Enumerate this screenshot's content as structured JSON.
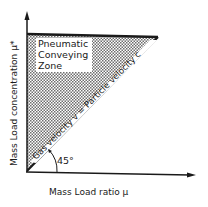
{
  "diagram": {
    "type": "phase diagram",
    "zone_label_lines": [
      "Pneumatic",
      "Conveying",
      "Zone"
    ],
    "diagonal_label": "Gas velocity v = Particle velocity c",
    "angle_label": "45°",
    "x_axis_label": "Mass Load ratio  μ",
    "y_axis_label": "Mass Load concentration  μ*",
    "colors": {
      "line": "#1a1a1a",
      "shade": "#8a8a8a",
      "background": "#ffffff"
    }
  }
}
